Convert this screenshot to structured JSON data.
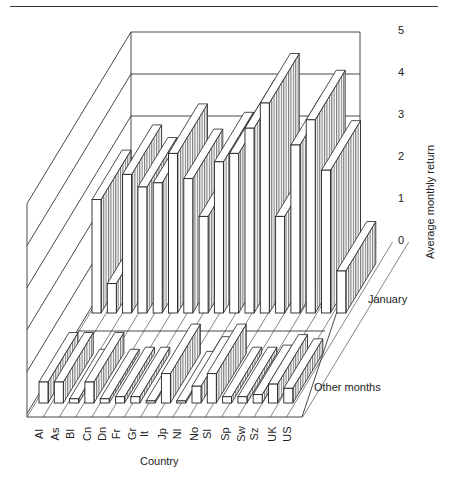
{
  "chart_data": {
    "type": "bar",
    "subtype": "3d-bar",
    "title": "",
    "xlabel": "Country",
    "ylabel": "Average monthly return",
    "ylim": [
      0,
      5
    ],
    "yticks": [
      0,
      1,
      2,
      3,
      4,
      5
    ],
    "grid": true,
    "legend_position": "row labels on right",
    "categories": [
      "Al",
      "As",
      "Bl",
      "Cn",
      "Dn",
      "Fr",
      "Gr",
      "It",
      "Jp",
      "Nl",
      "No",
      "Sl",
      "Sp",
      "Sw",
      "Sz",
      "UK",
      "US"
    ],
    "series": [
      {
        "name": "January",
        "values": [
          2.7,
          0.7,
          3.3,
          3.0,
          3.1,
          3.8,
          3.2,
          2.3,
          3.6,
          3.8,
          4.4,
          5.0,
          2.3,
          4.0,
          4.6,
          3.4,
          1.0
        ]
      },
      {
        "name": "Other months",
        "values": [
          0.5,
          0.5,
          0.1,
          0.5,
          0.1,
          0.15,
          0.15,
          0.05,
          0.7,
          0.05,
          0.4,
          0.7,
          0.15,
          0.15,
          0.2,
          0.45,
          0.35
        ]
      }
    ]
  },
  "labels": {
    "ylabel": "Average monthly return",
    "xlabel": "Country",
    "row_january": "January",
    "row_other": "Other months",
    "yticks": [
      "0",
      "1",
      "2",
      "3",
      "4",
      "5"
    ]
  },
  "colors": {
    "line": "#222222",
    "face": "#ffffff",
    "side_hatch": "#888888"
  }
}
